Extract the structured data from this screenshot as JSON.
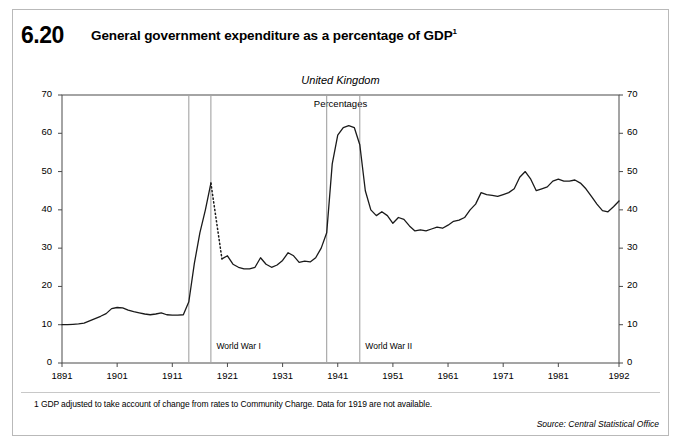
{
  "figure": {
    "number": "6.20",
    "title": "General government expenditure as a percentage of GDP",
    "title_superscript": "1"
  },
  "footnote": "1  GDP adjusted to take account of change from rates to Community Charge. Data for 1919 are not available.",
  "source": "Source: Central Statistical Office",
  "chart_data": {
    "type": "line",
    "title": "General government expenditure as a percentage of GDP",
    "subtitle": "United Kingdom",
    "units_label": "Percentages",
    "xlabel": "",
    "ylabel": "Percentages",
    "xlim": [
      1891,
      1992
    ],
    "ylim": [
      0,
      70
    ],
    "yticks": [
      0,
      10,
      20,
      30,
      40,
      50,
      60,
      70
    ],
    "xticks": [
      1891,
      1901,
      1911,
      1921,
      1931,
      1941,
      1951,
      1961,
      1971,
      1981,
      1992
    ],
    "grid": false,
    "legend": "none",
    "line_color": "#1a1a1a",
    "annotations": [
      {
        "label": "World War I",
        "span_start": 1914,
        "span_end": 1918,
        "label_x": 1919,
        "label_y": 4.2
      },
      {
        "label": "World War II",
        "span_start": 1939,
        "span_end": 1945,
        "label_x": 1946,
        "label_y": 4.2
      }
    ],
    "missing_data_note": "Data for 1919 are not available.",
    "dotted_segment": {
      "from_year": 1918,
      "from_value": 47.0,
      "to_year": 1920,
      "to_value": 27.2
    },
    "series": [
      {
        "name": "General government expenditure as a percentage of GDP",
        "x": [
          1891,
          1892,
          1893,
          1894,
          1895,
          1896,
          1897,
          1898,
          1899,
          1900,
          1901,
          1902,
          1903,
          1904,
          1905,
          1906,
          1907,
          1908,
          1909,
          1910,
          1911,
          1912,
          1913,
          1914,
          1915,
          1916,
          1917,
          1918,
          1920,
          1921,
          1922,
          1923,
          1924,
          1925,
          1926,
          1927,
          1928,
          1929,
          1930,
          1931,
          1932,
          1933,
          1934,
          1935,
          1936,
          1937,
          1938,
          1939,
          1940,
          1941,
          1942,
          1943,
          1944,
          1945,
          1946,
          1947,
          1948,
          1949,
          1950,
          1951,
          1952,
          1953,
          1954,
          1955,
          1956,
          1957,
          1958,
          1959,
          1960,
          1961,
          1962,
          1963,
          1964,
          1965,
          1966,
          1967,
          1968,
          1969,
          1970,
          1971,
          1972,
          1973,
          1974,
          1975,
          1976,
          1977,
          1978,
          1979,
          1980,
          1981,
          1982,
          1983,
          1984,
          1985,
          1986,
          1987,
          1988,
          1989,
          1990,
          1991,
          1992
        ],
        "values": [
          10.0,
          10.0,
          10.1,
          10.2,
          10.4,
          11.0,
          11.6,
          12.2,
          12.9,
          14.2,
          14.5,
          14.4,
          13.8,
          13.4,
          13.1,
          12.8,
          12.6,
          12.8,
          13.1,
          12.6,
          12.5,
          12.5,
          12.6,
          16.0,
          26.0,
          34.0,
          40.0,
          47.0,
          27.2,
          28.0,
          25.8,
          25.0,
          24.6,
          24.6,
          25.0,
          27.5,
          25.8,
          25.0,
          25.6,
          26.8,
          28.8,
          28.0,
          26.3,
          26.6,
          26.4,
          27.5,
          30.0,
          34.0,
          52.0,
          59.5,
          61.5,
          62.0,
          61.5,
          57.0,
          45.0,
          40.0,
          38.5,
          39.5,
          38.5,
          36.5,
          38.0,
          37.5,
          35.8,
          34.5,
          34.8,
          34.5,
          35.0,
          35.5,
          35.2,
          36.0,
          37.0,
          37.3,
          38.0,
          40.0,
          41.5,
          44.5,
          44.0,
          43.8,
          43.5,
          44.0,
          44.5,
          45.5,
          48.5,
          50.0,
          48.0,
          45.0,
          45.5,
          46.0,
          47.5,
          48.0,
          47.5,
          47.5,
          47.8,
          47.0,
          45.5,
          43.5,
          41.5,
          39.8,
          39.5,
          40.8,
          42.3
        ]
      }
    ]
  },
  "axes": {
    "y_left_labels": [
      "70",
      "60",
      "50",
      "40",
      "30",
      "20",
      "10",
      "0"
    ],
    "y_right_labels": [
      "70",
      "60",
      "50",
      "40",
      "30",
      "20",
      "10",
      "0"
    ],
    "x_labels": [
      "1891",
      "1901",
      "1911",
      "1921",
      "1931",
      "1941",
      "1951",
      "1961",
      "1971",
      "1981",
      "1992"
    ]
  },
  "annotations": {
    "war1_label": "World War I",
    "war2_label": "World War II",
    "region": "United Kingdom",
    "units": "Percentages"
  }
}
